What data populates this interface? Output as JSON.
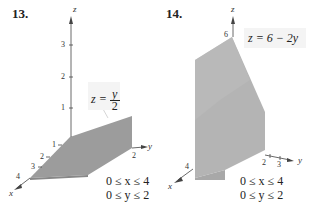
{
  "figures": [
    {
      "number": "13.",
      "equation": "z = y/2",
      "equation_lhs": "z =",
      "equation_num": "y",
      "equation_den": "2",
      "constraints": [
        "0 ≤ x ≤ 4",
        "0 ≤ y ≤ 2"
      ],
      "axes": {
        "x": "x",
        "y": "y",
        "z": "z"
      },
      "z_ticks": [
        "1",
        "2",
        "3"
      ],
      "x_ticks": [
        "1",
        "2",
        "3",
        "4"
      ],
      "y_ticks": [
        "2"
      ]
    },
    {
      "number": "14.",
      "equation": "z = 6 − 2y",
      "constraints": [
        "0 ≤ x ≤ 4",
        "0 ≤ y ≤ 2"
      ],
      "axes": {
        "x": "x",
        "y": "y",
        "z": "z"
      },
      "z_ticks": [
        "6"
      ],
      "x_ticks": [
        "4"
      ],
      "y_ticks": [
        "2",
        "3"
      ]
    }
  ],
  "colors": {
    "solid_fill": "#9a9a9a",
    "solid_light": "#b8b8b8",
    "label_box": "#f4f4f4"
  }
}
